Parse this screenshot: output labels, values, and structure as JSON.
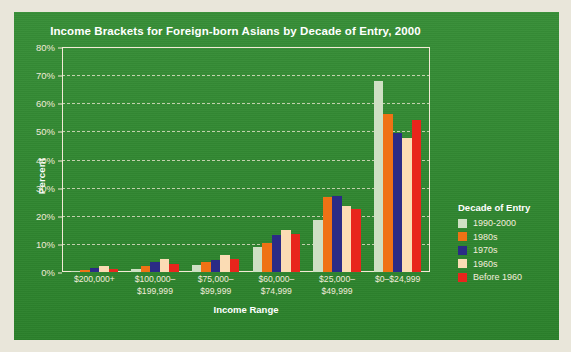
{
  "chart_data": {
    "type": "bar",
    "title": "Income Brackets for Foreign-born Asians by Decade of Entry, 2000",
    "xlabel": "Income Range",
    "ylabel": "Percent",
    "ylim": [
      0,
      80
    ],
    "yticks": [
      "0%",
      "10%",
      "20%",
      "30%",
      "40%",
      "50%",
      "60%",
      "70%",
      "80%"
    ],
    "ytick_values": [
      0,
      10,
      20,
      30,
      40,
      50,
      60,
      70,
      80
    ],
    "grid": true,
    "legend_position": "right",
    "legend_title": "Decade of Entry",
    "categories": [
      "$200,000+",
      "$100,000–\n$199,999",
      "$75,000–\n$99,999",
      "$60,000–\n$74,999",
      "$25,000–\n$49,999",
      "$0–$24,999"
    ],
    "series": [
      {
        "name": "1990-2000",
        "color": "#cfe0c4",
        "values": [
          0.3,
          1.2,
          2.6,
          8.8,
          18.5,
          68.0
        ]
      },
      {
        "name": "1980s",
        "color": "#ef7215",
        "values": [
          0.6,
          2.0,
          3.5,
          10.4,
          26.5,
          56.2
        ]
      },
      {
        "name": "1970s",
        "color": "#2b2b86",
        "values": [
          1.4,
          3.6,
          4.2,
          13.0,
          27.2,
          49.5
        ]
      },
      {
        "name": "1960s",
        "color": "#fbdcb4",
        "values": [
          2.2,
          4.6,
          6.0,
          15.0,
          23.6,
          47.8
        ]
      },
      {
        "name": "Before 1960",
        "color": "#e8251c",
        "values": [
          1.0,
          2.8,
          4.5,
          13.5,
          22.4,
          54.2
        ]
      }
    ]
  },
  "colors": {
    "panel_background": "#2f8a2f",
    "page_background": "#e9e6da",
    "axis": "#f3ead6",
    "text_light": "#f2ecdc",
    "text_white": "#ffffff"
  }
}
